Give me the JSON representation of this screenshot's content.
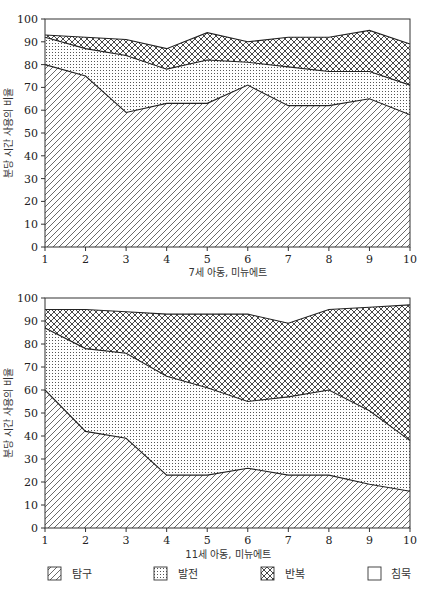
{
  "chart_data": [
    {
      "type": "area",
      "stacked": true,
      "title": "",
      "xlabel": "7세 아동, 미뉴에트",
      "ylabel": "분당 시간 사용의 비율",
      "x": [
        1,
        2,
        3,
        4,
        5,
        6,
        7,
        8,
        9,
        10
      ],
      "ylim": [
        0,
        100
      ],
      "yticks": [
        0,
        10,
        20,
        30,
        40,
        50,
        60,
        70,
        80,
        90,
        100
      ],
      "grid": false,
      "cumulative_boundaries": {
        "탐구": [
          80,
          75,
          59,
          63,
          63,
          71,
          62,
          62,
          65,
          58
        ],
        "발전": [
          92,
          87,
          84,
          78,
          82,
          81,
          79,
          77,
          77,
          71
        ],
        "반복": [
          93,
          92,
          91,
          87,
          94,
          90,
          92,
          92,
          95,
          89
        ],
        "침묵": [
          100,
          100,
          100,
          100,
          100,
          100,
          100,
          100,
          100,
          100
        ]
      },
      "series": [
        {
          "name": "탐구",
          "values": [
            80,
            75,
            59,
            63,
            63,
            71,
            62,
            62,
            65,
            58
          ]
        },
        {
          "name": "발전",
          "values": [
            12,
            12,
            25,
            15,
            19,
            10,
            17,
            15,
            12,
            13
          ]
        },
        {
          "name": "반복",
          "values": [
            1,
            5,
            7,
            9,
            12,
            9,
            13,
            15,
            18,
            18
          ]
        },
        {
          "name": "침묵",
          "values": [
            7,
            8,
            9,
            13,
            6,
            10,
            8,
            8,
            5,
            11
          ]
        }
      ]
    },
    {
      "type": "area",
      "stacked": true,
      "title": "",
      "xlabel": "11세 아동, 미뉴에트",
      "ylabel": "분당 시간 사용의 비율",
      "x": [
        1,
        2,
        3,
        4,
        5,
        6,
        7,
        8,
        9,
        10
      ],
      "ylim": [
        0,
        100
      ],
      "yticks": [
        0,
        10,
        20,
        30,
        40,
        50,
        60,
        70,
        80,
        90,
        100
      ],
      "grid": false,
      "cumulative_boundaries": {
        "탐구": [
          60,
          42,
          39,
          23,
          23,
          26,
          23,
          23,
          19,
          16
        ],
        "발전": [
          87,
          78,
          76,
          66,
          61,
          55,
          57,
          60,
          51,
          38
        ],
        "반복": [
          95,
          95,
          94,
          93,
          93,
          93,
          89,
          95,
          96,
          97
        ],
        "침묵": [
          100,
          100,
          100,
          100,
          100,
          100,
          100,
          100,
          100,
          100
        ]
      },
      "series": [
        {
          "name": "탐구",
          "values": [
            60,
            42,
            39,
            23,
            23,
            26,
            23,
            23,
            19,
            16
          ]
        },
        {
          "name": "발전",
          "values": [
            27,
            36,
            37,
            43,
            38,
            29,
            34,
            37,
            32,
            22
          ]
        },
        {
          "name": "반복",
          "values": [
            8,
            17,
            18,
            27,
            32,
            38,
            32,
            35,
            45,
            59
          ]
        },
        {
          "name": "침묵",
          "values": [
            5,
            5,
            6,
            7,
            7,
            7,
            11,
            5,
            4,
            3
          ]
        }
      ]
    }
  ],
  "charts": [
    {
      "xlabel": "7세 아동, 미뉴에트",
      "ylabel": "분당 시간 사용의 비율"
    },
    {
      "xlabel": "11세 아동, 미뉴에트",
      "ylabel": "분당 시간 사용의 비율"
    }
  ],
  "legend": {
    "items": [
      {
        "label": "탐구",
        "pattern": "diagonal-hatch"
      },
      {
        "label": "발전",
        "pattern": "dots"
      },
      {
        "label": "반복",
        "pattern": "crosshatch"
      },
      {
        "label": "침묵",
        "pattern": "blank"
      }
    ]
  },
  "colors": {
    "line": "#222222",
    "pattern": "#444444",
    "background": "#ffffff"
  }
}
